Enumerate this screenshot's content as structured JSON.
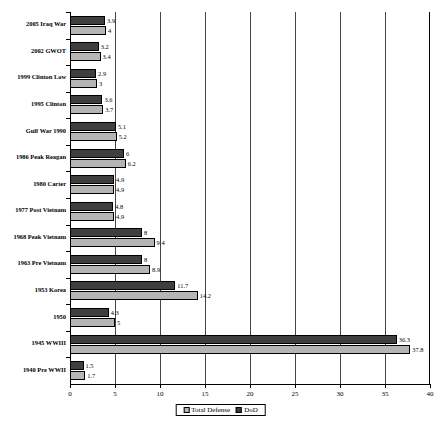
{
  "chart_data": {
    "type": "bar",
    "orientation": "horizontal",
    "title": "",
    "subtitle": "",
    "xlabel": "",
    "ylabel": "",
    "xlim": [
      0,
      40
    ],
    "xticks": [
      0,
      5,
      10,
      15,
      20,
      25,
      30,
      35,
      40
    ],
    "grid": true,
    "legend_position": "bottom",
    "categories": [
      "2005 Iraq War",
      "2002 GWOT",
      "1999 Clinton Low",
      "1995 Clinton",
      "Gulf  War 1990",
      "1986 Peak Reagan",
      "1980 Carter",
      "1977 Post Vietnam",
      "1968 Peak Vietnam",
      "1963 Pre Vietnam",
      "1953 Korea",
      "1950",
      "1945 WWIII",
      "1940 Pre WWII"
    ],
    "series": [
      {
        "name": "DoD",
        "color": "#3f3f3f",
        "values": [
          3.9,
          3.2,
          2.9,
          3.6,
          5.1,
          6,
          4.9,
          4.8,
          8,
          8,
          11.7,
          4.3,
          36.3,
          1.5
        ],
        "labels": [
          "3.9",
          "3.2",
          "2.9",
          "3.6",
          "5.1",
          "6",
          "4.9",
          "4.8",
          "8",
          "8",
          "11.7",
          "4.3",
          "36.3",
          "1.5"
        ]
      },
      {
        "name": "Total Defense",
        "color": "#b5b5b5",
        "values": [
          4,
          3.4,
          3,
          3.7,
          5.2,
          6.2,
          4.9,
          4.9,
          9.4,
          8.9,
          14.2,
          5,
          37.8,
          1.7
        ],
        "labels": [
          "4",
          "3.4",
          "3",
          "3.7",
          "5.2",
          "6.2",
          "4.9",
          "4.9",
          "9.4",
          "8.9",
          "14.2",
          "5",
          "37.8",
          "1.7"
        ]
      }
    ],
    "legend": [
      "Total Defense",
      "DoD"
    ]
  }
}
